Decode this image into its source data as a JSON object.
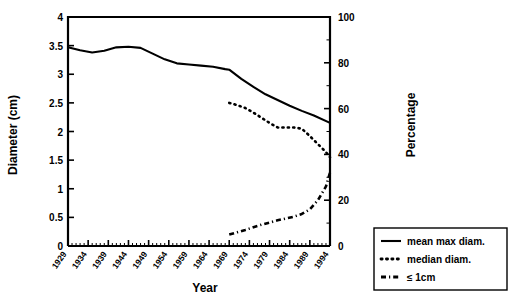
{
  "chart_data": {
    "type": "line",
    "title": "",
    "xlabel": "Year",
    "ylabel": "Diameter (cm)",
    "y2label": "Percentage",
    "xlim": [
      1929,
      1994
    ],
    "ylim": [
      0,
      4
    ],
    "y2lim": [
      0,
      100
    ],
    "grid": false,
    "legend_position": "bottom-right",
    "x_tick_labels": [
      "1929",
      "1934",
      "1939",
      "1944",
      "1949",
      "1954",
      "1959",
      "1964",
      "1969",
      "1974",
      "1979",
      "1984",
      "1989",
      "1994"
    ],
    "x_tick_values": [
      1929,
      1934,
      1939,
      1944,
      1949,
      1954,
      1959,
      1964,
      1969,
      1974,
      1979,
      1984,
      1989,
      1994
    ],
    "y_tick_labels": [
      "0",
      "0.5",
      "1",
      "1.5",
      "2",
      "2.5",
      "3",
      "3.5",
      "4"
    ],
    "y_tick_values": [
      0,
      0.5,
      1,
      1.5,
      2,
      2.5,
      3,
      3.5,
      4
    ],
    "y2_tick_labels": [
      "0",
      "20",
      "40",
      "60",
      "80",
      "100"
    ],
    "y2_tick_values": [
      0,
      20,
      40,
      60,
      80,
      100
    ],
    "minor_x_tick_interval": 1,
    "series": [
      {
        "name": "mean max diam.",
        "style": "solid",
        "axis": "left",
        "x": [
          1929,
          1932,
          1935,
          1938,
          1941,
          1944,
          1947,
          1950,
          1953,
          1956,
          1959,
          1962,
          1965,
          1968,
          1969,
          1972,
          1975,
          1978,
          1981,
          1984,
          1987,
          1990,
          1994
        ],
        "values": [
          3.47,
          3.42,
          3.38,
          3.41,
          3.47,
          3.48,
          3.46,
          3.36,
          3.26,
          3.19,
          3.17,
          3.15,
          3.13,
          3.09,
          3.08,
          2.92,
          2.78,
          2.65,
          2.55,
          2.45,
          2.36,
          2.28,
          2.15
        ]
      },
      {
        "name": "median diam.",
        "style": "dotted",
        "axis": "left",
        "x": [
          1969,
          1971,
          1973,
          1975,
          1977,
          1979,
          1981,
          1983,
          1985,
          1987,
          1989,
          1991,
          1993,
          1994
        ],
        "values": [
          2.5,
          2.46,
          2.41,
          2.33,
          2.24,
          2.15,
          2.07,
          2.07,
          2.07,
          2.05,
          1.92,
          1.78,
          1.64,
          1.55
        ]
      },
      {
        "name": "≤ 1cm",
        "style": "dash-dot",
        "axis": "right",
        "x": [
          1969,
          1971,
          1973,
          1975,
          1977,
          1979,
          1981,
          1983,
          1985,
          1987,
          1989,
          1991,
          1993,
          1994
        ],
        "values": [
          5.0,
          6.0,
          7.0,
          8.2,
          9.3,
          10.2,
          11.2,
          12.0,
          12.8,
          14.0,
          16.0,
          20.0,
          26.0,
          32.0
        ]
      }
    ]
  },
  "legend": {
    "items": [
      {
        "label": "mean max diam.",
        "style": "solid"
      },
      {
        "label": "median diam.",
        "style": "dotted"
      },
      {
        "label": "≤ 1cm",
        "style": "dash-dot"
      }
    ]
  }
}
